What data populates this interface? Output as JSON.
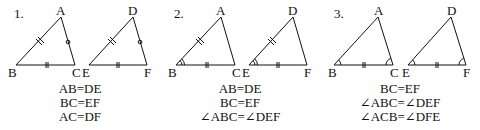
{
  "panels": [
    {
      "number": "1.",
      "vertices": {
        "A": "A",
        "B": "B",
        "C": "C",
        "D": "D",
        "E": "E",
        "F": "F"
      },
      "conditions": [
        "AB=DE",
        "BC=EF",
        "AC=DF"
      ]
    },
    {
      "number": "2.",
      "vertices": {
        "A": "A",
        "B": "B",
        "C": "C",
        "D": "D",
        "E": "E",
        "F": "F"
      },
      "conditions": [
        "AB=DE",
        "BC=EF",
        "∠ABC=∠DEF"
      ]
    },
    {
      "number": "3.",
      "vertices": {
        "A": "A",
        "B": "B",
        "C": "C",
        "D": "D",
        "E": "E",
        "F": "F"
      },
      "conditions": [
        "BC=EF",
        "∠ABC=∠DEF",
        "∠ACB=∠DFE"
      ]
    }
  ]
}
